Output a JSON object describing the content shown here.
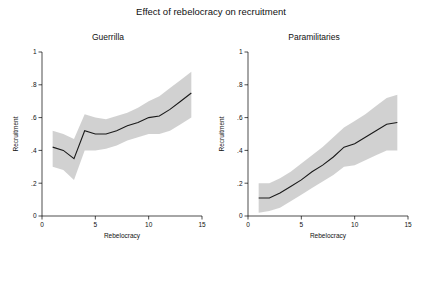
{
  "figure": {
    "title": "Effect of rebelocracy on recruitment"
  },
  "chart_data": [
    {
      "type": "line",
      "title": "Guerrilla",
      "xlabel": "Rebelocracy",
      "ylabel": "Recruitment",
      "xlim": [
        0,
        15
      ],
      "ylim": [
        0,
        1
      ],
      "xticks": [
        0,
        5,
        10,
        15
      ],
      "xticklabels": [
        "0",
        "5",
        "10",
        "15"
      ],
      "yticks": [
        0,
        0.2,
        0.4,
        0.6,
        0.8,
        1
      ],
      "yticklabels": [
        "0",
        ".2",
        ".4",
        ".6",
        ".8",
        "1"
      ],
      "grid": false,
      "legend": "none",
      "band_color": "#cfcfcf",
      "line_color": "#1a1a1a",
      "x": [
        1,
        2,
        3,
        4,
        5,
        6,
        7,
        8,
        9,
        10,
        11,
        12,
        13,
        14
      ],
      "series": [
        {
          "name": "Predicted recruitment",
          "values": [
            0.42,
            0.4,
            0.35,
            0.52,
            0.5,
            0.5,
            0.52,
            0.55,
            0.57,
            0.6,
            0.61,
            0.65,
            0.7,
            0.75
          ]
        },
        {
          "name": "95% CI upper",
          "values": [
            0.52,
            0.5,
            0.47,
            0.62,
            0.6,
            0.59,
            0.61,
            0.63,
            0.66,
            0.7,
            0.73,
            0.78,
            0.83,
            0.88
          ]
        },
        {
          "name": "95% CI lower",
          "values": [
            0.3,
            0.28,
            0.22,
            0.4,
            0.4,
            0.41,
            0.43,
            0.46,
            0.48,
            0.5,
            0.5,
            0.52,
            0.56,
            0.6
          ]
        }
      ]
    },
    {
      "type": "line",
      "title": "Paramilitaries",
      "xlabel": "Rebelocracy",
      "ylabel": "Recruitment",
      "xlim": [
        0,
        15
      ],
      "ylim": [
        0,
        1
      ],
      "xticks": [
        0,
        5,
        10,
        15
      ],
      "xticklabels": [
        "0",
        "5",
        "10",
        "15"
      ],
      "yticks": [
        0,
        0.2,
        0.4,
        0.6,
        0.8,
        1
      ],
      "yticklabels": [
        "0",
        ".2",
        ".4",
        ".6",
        ".8",
        "1"
      ],
      "grid": false,
      "legend": "none",
      "band_color": "#cfcfcf",
      "line_color": "#1a1a1a",
      "x": [
        1,
        2,
        3,
        4,
        5,
        6,
        7,
        8,
        9,
        10,
        11,
        12,
        13,
        14
      ],
      "series": [
        {
          "name": "Predicted recruitment",
          "values": [
            0.11,
            0.11,
            0.14,
            0.18,
            0.22,
            0.27,
            0.31,
            0.36,
            0.42,
            0.44,
            0.48,
            0.52,
            0.56,
            0.57
          ]
        },
        {
          "name": "95% CI upper",
          "values": [
            0.2,
            0.2,
            0.23,
            0.27,
            0.32,
            0.37,
            0.42,
            0.48,
            0.54,
            0.58,
            0.62,
            0.67,
            0.72,
            0.74
          ]
        },
        {
          "name": "95% CI lower",
          "values": [
            0.02,
            0.03,
            0.05,
            0.09,
            0.13,
            0.17,
            0.21,
            0.25,
            0.3,
            0.31,
            0.34,
            0.37,
            0.4,
            0.4
          ]
        }
      ]
    }
  ]
}
